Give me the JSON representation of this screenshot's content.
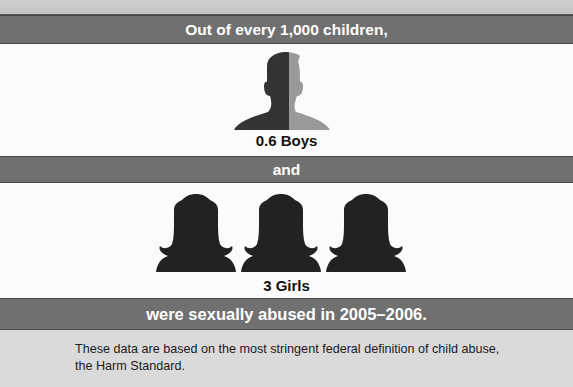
{
  "header": {
    "text": "Out of every 1,000 children,"
  },
  "boys": {
    "label": "0.6 Boys",
    "value": 0.6,
    "icon": "boy-silhouette-icon",
    "colors": {
      "filled": "#333333",
      "partial": "#999999"
    }
  },
  "connector": {
    "text": "and"
  },
  "girls": {
    "label": "3 Girls",
    "value": 3,
    "icon": "girl-silhouette-icon",
    "color": "#222222"
  },
  "conclusion": {
    "text": "were sexually abused in 2005–2006."
  },
  "footnote": {
    "text": "These data are based on the most stringent federal definition of child abuse, the Harm Standard."
  },
  "colors": {
    "band": "#707070",
    "band_text": "#ffffff",
    "panel": "#fbfbfb",
    "footer_bg": "#dadada"
  }
}
